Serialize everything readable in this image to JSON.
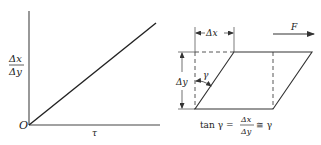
{
  "left_graph": {
    "origin_label": "O",
    "x_axis_label": "τ",
    "y_axis_label_numerator": "Δx",
    "y_axis_label_denominator": "Δy",
    "line": {
      "from": [
        0,
        0
      ],
      "to": "linear increasing"
    }
  },
  "right_diagram": {
    "dx_label": "Δx",
    "dy_label": "Δy",
    "angle_label": "γ",
    "force_label": "F",
    "equation": {
      "lhs": "tan γ =",
      "frac_numerator": "Δx",
      "frac_denominator": "Δy",
      "rhs": "≅ γ"
    }
  },
  "colors": {
    "stroke": "#333333",
    "background": "#ffffff"
  }
}
